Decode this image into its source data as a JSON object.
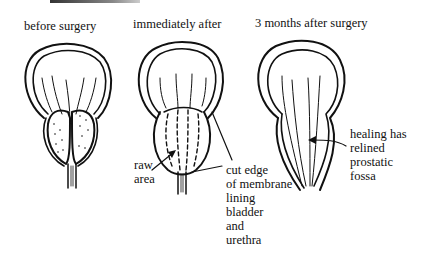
{
  "figures": [
    {
      "id": "before",
      "title": "before surgery"
    },
    {
      "id": "immediately",
      "title": "immediately after"
    },
    {
      "id": "three-months",
      "title": "3 months after surgery"
    }
  ],
  "annotations": {
    "raw_area": [
      "raw",
      "area"
    ],
    "cut_edge": [
      "cut edge",
      "of membrane",
      "lining",
      "bladder",
      "and",
      "urethra"
    ],
    "healing": [
      "healing has",
      "relined",
      "prostatic",
      "fossa"
    ]
  }
}
